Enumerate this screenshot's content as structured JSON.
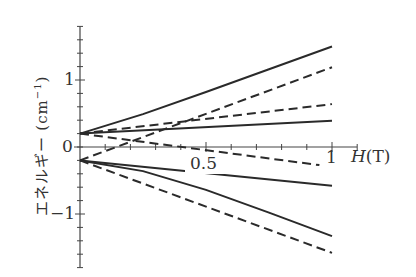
{
  "chart_data": {
    "type": "line",
    "title": "",
    "xlabel": "H(T)",
    "ylabel": "エネルギー (cm⁻¹)",
    "xlim": [
      0,
      1.1
    ],
    "ylim": [
      -1.8,
      1.8
    ],
    "x_ticks": [
      0.5,
      1
    ],
    "x_tick_labels": [
      "0.5",
      "1"
    ],
    "y_ticks": [
      -1,
      0,
      1
    ],
    "y_tick_labels": [
      "−1",
      "0",
      "1"
    ],
    "minor_tick_step_x": 0.1,
    "minor_tick_step_y": 0.2,
    "grid": false,
    "legend": null,
    "series": [
      {
        "name": "upper-solid-steep",
        "style": "solid",
        "x": [
          0,
          0.25,
          0.5,
          0.75,
          1
        ],
        "y": [
          0.2,
          0.49,
          0.82,
          1.16,
          1.5
        ]
      },
      {
        "name": "upper-dashed-mid",
        "style": "dashed",
        "x": [
          0,
          1
        ],
        "y": [
          0.2,
          0.64
        ]
      },
      {
        "name": "upper-solid-shallow",
        "style": "solid",
        "x": [
          0,
          1
        ],
        "y": [
          0.2,
          0.39
        ]
      },
      {
        "name": "upper-dashed-down",
        "style": "dashed",
        "x": [
          0,
          0.95
        ],
        "y": [
          0.2,
          -0.27
        ]
      },
      {
        "name": "lower-dashed-up",
        "style": "dashed",
        "x": [
          0,
          1
        ],
        "y": [
          -0.2,
          1.19
        ]
      },
      {
        "name": "lower-solid-shallow",
        "style": "solid",
        "x": [
          0,
          1
        ],
        "y": [
          -0.2,
          -0.58
        ]
      },
      {
        "name": "lower-solid-steep",
        "style": "solid",
        "x": [
          0,
          0.25,
          0.5,
          0.75,
          1
        ],
        "y": [
          -0.2,
          -0.36,
          -0.64,
          -0.98,
          -1.33
        ]
      },
      {
        "name": "lower-dashed-steep",
        "style": "dashed",
        "x": [
          0,
          1
        ],
        "y": [
          -0.2,
          -1.58
        ]
      }
    ]
  },
  "labels": {
    "ylabel_text": "エネルギー (cm",
    "ylabel_sup": "−1",
    "ylabel_close": ")",
    "xlabel_var": "H",
    "xlabel_unit": "(T)",
    "xtick_05": "0.5",
    "xtick_1": "1",
    "ytick_1": "1",
    "ytick_0": "0",
    "ytick_m1": "−1"
  },
  "colors": {
    "line": "#2a2a2a",
    "axis": "#444444",
    "text": "#333333"
  }
}
